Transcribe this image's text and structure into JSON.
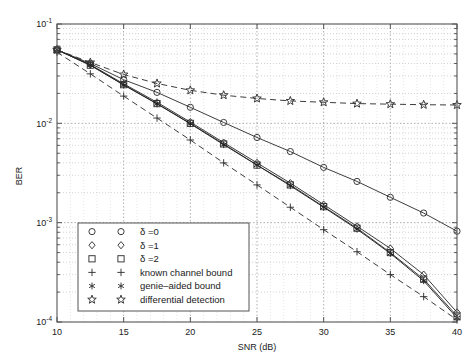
{
  "chart_data": {
    "type": "line",
    "title": "",
    "xlabel": "SNR (dB)",
    "ylabel": "BER",
    "xlim": [
      10,
      40
    ],
    "ylim": [
      0.0001,
      0.1
    ],
    "yscale": "log",
    "xscale": "linear",
    "grid": true,
    "grid_style": "dotted",
    "legend_position": "lower-left-inside",
    "xticks": [
      10,
      15,
      20,
      25,
      30,
      35,
      40
    ],
    "xticklabels": [
      "10",
      "15",
      "20",
      "25",
      "30",
      "35",
      "40"
    ],
    "yticks": [
      0.1,
      0.01,
      0.001,
      0.0001
    ],
    "yticklabels": [
      "10^-1",
      "10^-2",
      "10^-3",
      "10^-4"
    ],
    "x": [
      10,
      12.5,
      15,
      17.5,
      20,
      22.5,
      25,
      27.5,
      30,
      32.5,
      35,
      37.5,
      40
    ],
    "series": [
      {
        "name": "delta=0",
        "label": "δ =0",
        "marker": "circle",
        "linestyle": "solid",
        "color": "#333333",
        "values": [
          0.055,
          0.04,
          0.0275,
          0.0205,
          0.0145,
          0.0102,
          0.0072,
          0.0052,
          0.0036,
          0.0026,
          0.0018,
          0.00125,
          0.00082
        ]
      },
      {
        "name": "delta=1",
        "label": "δ =1",
        "marker": "diamond",
        "linestyle": "solid",
        "color": "#333333",
        "values": [
          0.055,
          0.039,
          0.025,
          0.0163,
          0.0103,
          0.0064,
          0.004,
          0.0025,
          0.00152,
          0.00092,
          0.00055,
          0.0003,
          0.000125
        ]
      },
      {
        "name": "delta=2",
        "label": "δ =2",
        "marker": "square",
        "linestyle": "solid",
        "color": "#333333",
        "values": [
          0.055,
          0.0385,
          0.0245,
          0.0158,
          0.01,
          0.0062,
          0.0038,
          0.0024,
          0.00145,
          0.00088,
          0.0005,
          0.00027,
          0.000115
        ]
      },
      {
        "name": "known channel bound",
        "label": "known channel bound",
        "marker": "plus",
        "linestyle": "dashed",
        "color": "#333333",
        "values": [
          0.052,
          0.0315,
          0.0188,
          0.0113,
          0.0068,
          0.004,
          0.0024,
          0.00143,
          0.00085,
          0.00051,
          0.0003,
          0.00018,
          0.000105
        ]
      },
      {
        "name": "genie-aided bound",
        "label": "genie–aided bound",
        "marker": "asterisk",
        "linestyle": "solid",
        "color": "#222222",
        "values": [
          0.055,
          0.0385,
          0.0243,
          0.0157,
          0.0099,
          0.0061,
          0.0038,
          0.00235,
          0.00143,
          0.00086,
          0.00049,
          0.00026,
          0.00011
        ]
      },
      {
        "name": "differential detection",
        "label": "differential detection",
        "marker": "star",
        "linestyle": "dashed",
        "color": "#333333",
        "values": [
          0.055,
          0.041,
          0.031,
          0.0252,
          0.0215,
          0.0192,
          0.0178,
          0.0168,
          0.0163,
          0.0158,
          0.0156,
          0.0154,
          0.0153
        ]
      }
    ]
  },
  "legend": {
    "entries": [
      {
        "label": "δ =0",
        "marker": "circle"
      },
      {
        "label": "δ =1",
        "marker": "diamond"
      },
      {
        "label": "δ =2",
        "marker": "square"
      },
      {
        "label": "known channel bound",
        "marker": "plus"
      },
      {
        "label": "genie–aided bound",
        "marker": "asterisk"
      },
      {
        "label": "differential detection",
        "marker": "star"
      }
    ]
  },
  "axes": {
    "x_title": "SNR (dB)",
    "y_title": "BER",
    "y_tick_mantissa": "10",
    "y_tick_exponents": [
      "-1",
      "-2",
      "-3",
      "-4"
    ],
    "x_tick_labels": [
      "10",
      "15",
      "20",
      "25",
      "30",
      "35",
      "40"
    ]
  }
}
